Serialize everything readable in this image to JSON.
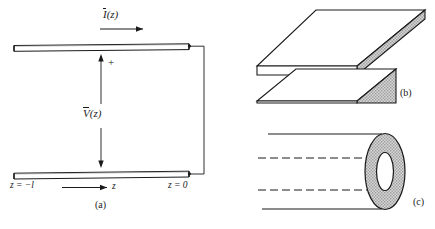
{
  "figure": {
    "type": "transmission-line-structures",
    "panels": [
      {
        "id": "a",
        "caption": "(a)",
        "name": "two-conductor-transmission-line",
        "labels": {
          "current": "I (z)",
          "current_symbol": "I",
          "current_arg": "(z)",
          "voltage": "V (z)",
          "voltage_symbol": "V",
          "voltage_arg": "(z)",
          "polarity": "+",
          "z_left": "z = −l",
          "z_right": "z = 0",
          "z_axis": "z"
        }
      },
      {
        "id": "b",
        "caption": "(b)",
        "name": "parallel-plate-waveguide"
      },
      {
        "id": "c",
        "caption": "(c)",
        "name": "coaxial-cable"
      }
    ],
    "colors": {
      "line": "#1a1a1a",
      "fill_shade": "#c9c9c9",
      "background": "#ffffff",
      "text": "#1a1a1a"
    }
  }
}
